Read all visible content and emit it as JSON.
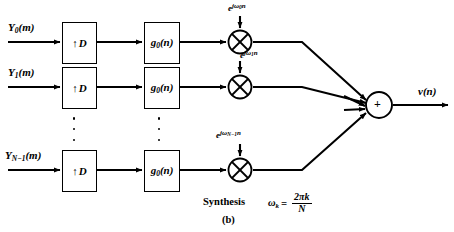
{
  "figure": {
    "caption": "Synthesis",
    "subfigure_label": "(b)",
    "formula": {
      "lhs": "ω",
      "lhs_sub": "k",
      "eq": "=",
      "numerator": "2πk",
      "denominator": "N"
    },
    "output_label": "v(n)"
  },
  "branches": [
    {
      "input_label": "Y",
      "input_sub": "0",
      "input_arg": "(m)",
      "upsampler": {
        "arrow": "↑",
        "factor": "D"
      },
      "filter": {
        "name": "g",
        "sub": "0",
        "arg": "(n)"
      },
      "multiplier": "multiply",
      "carrier": {
        "base": "e",
        "exp_j": "j",
        "exp_omega": "ω",
        "exp_sub": "0",
        "exp_n": "n"
      }
    },
    {
      "input_label": "Y",
      "input_sub": "1",
      "input_arg": "(m)",
      "upsampler": {
        "arrow": "↑",
        "factor": "D"
      },
      "filter": {
        "name": "g",
        "sub": "0",
        "arg": "(n)"
      },
      "multiplier": "multiply",
      "carrier": {
        "base": "e",
        "exp_j": "j",
        "exp_omega": "ω",
        "exp_sub": "1",
        "exp_n": "n"
      }
    },
    {
      "input_label": "Y",
      "input_sub": "N−1",
      "input_arg": "(m)",
      "upsampler": {
        "arrow": "↑",
        "factor": "D"
      },
      "filter": {
        "name": "g",
        "sub": "0",
        "arg": "(n)"
      },
      "multiplier": "multiply",
      "carrier": {
        "base": "e",
        "exp_j": "j",
        "exp_omega": "ω",
        "exp_sub": "N−1",
        "exp_n": "n"
      }
    }
  ],
  "summer": {
    "symbol": "+"
  },
  "colors": {
    "ink": "#000000",
    "paper": "#ffffff"
  }
}
